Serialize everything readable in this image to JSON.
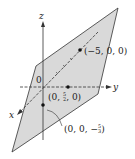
{
  "figure": {
    "axes": {
      "x": "x",
      "y": "y",
      "z": "z",
      "origin": "0"
    },
    "points": [
      {
        "label": "(−5, 0, 0)",
        "coords": [
          -5,
          0,
          0
        ]
      },
      {
        "label_prefix": "(0, ",
        "frac_num": "5",
        "frac_den": "2",
        "label_suffix": ", 0)",
        "coords": [
          0,
          2.5,
          0
        ]
      },
      {
        "label_prefix": "(0, 0, −",
        "frac_num": "5",
        "frac_den": "3",
        "label_suffix": ")",
        "coords": [
          0,
          0,
          -1.6667
        ]
      }
    ],
    "colors": {
      "plane_fill": "#d9d9d9",
      "lines": "#222222"
    }
  }
}
